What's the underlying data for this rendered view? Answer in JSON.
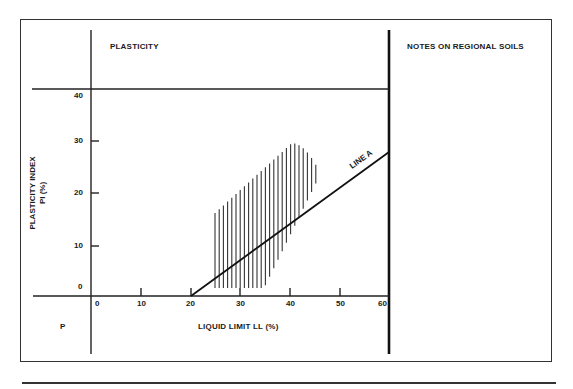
{
  "panels": {
    "plasticity_title": "PLASTICITY",
    "notes_title": "NOTES ON REGIONAL SOILS",
    "corner_label": "P"
  },
  "axes": {
    "x_label": "LIQUID LIMIT LL (%)",
    "y_label_line1": "PLASTICITY INDEX",
    "y_label_line2": "PI (%)",
    "x_ticks": [
      "0",
      "10",
      "20",
      "30",
      "40",
      "50",
      "60"
    ],
    "y_ticks": [
      "0",
      "10",
      "20",
      "30",
      "40"
    ]
  },
  "line_a_label": "LINE A",
  "colors": {
    "ink": "#1a1a1a",
    "frame": "#333333",
    "background": "#ffffff"
  },
  "chart_data": {
    "type": "line",
    "title": "PLASTICITY",
    "xlabel": "LIQUID LIMIT LL (%)",
    "ylabel": "PLASTICITY INDEX PI (%)",
    "xlim": [
      0,
      60
    ],
    "ylim": [
      0,
      40
    ],
    "x_ticks": [
      0,
      10,
      20,
      30,
      40,
      50,
      60
    ],
    "y_ticks": [
      0,
      10,
      20,
      30,
      40
    ],
    "grid": false,
    "series": [
      {
        "name": "LINE A",
        "x": [
          20,
          60
        ],
        "y": [
          0,
          29
        ]
      },
      {
        "name": "Regional soil range (hatched region)",
        "polygon_ll_pi": [
          [
            25,
            1.6
          ],
          [
            25,
            16.3
          ],
          [
            40.4,
            30
          ],
          [
            45.3,
            26
          ],
          [
            45.3,
            22
          ],
          [
            35,
            1.6
          ]
        ]
      }
    ],
    "annotations": [
      "LINE A"
    ]
  }
}
